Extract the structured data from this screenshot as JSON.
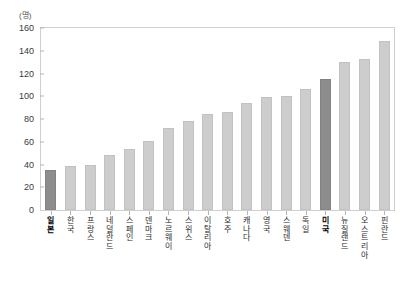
{
  "chart_data": {
    "type": "bar",
    "title": "",
    "subtitle": "",
    "unit_label": "(명)",
    "xlabel": "",
    "ylabel": "",
    "ylim": [
      0,
      160
    ],
    "ytick_step": 20,
    "yticks": [
      160,
      140,
      120,
      100,
      80,
      60,
      40,
      20,
      0
    ],
    "grid": false,
    "legend": "none",
    "categories": [
      "일본",
      "한국",
      "프랑스",
      "네덜란드",
      "스페인",
      "덴마크",
      "노르웨이",
      "스위스",
      "이탈리아",
      "호주",
      "캐나다",
      "영국",
      "스웨덴",
      "독일",
      "미국",
      "뉴질랜드",
      "오스트리아",
      "핀란드"
    ],
    "values": [
      35,
      38.5,
      40,
      48.5,
      54,
      60.5,
      72.5,
      78.5,
      84.5,
      86,
      94,
      99,
      100,
      106.5,
      115,
      130,
      133,
      148.5
    ],
    "highlighted": [
      "일본",
      "미국"
    ],
    "colors": {
      "bar": "#cdcdcd",
      "bar_highlight": "#8d8d8d",
      "frame": "#cfcfcf",
      "tick": "#b5b5b5",
      "text": "#2b2b2b"
    }
  }
}
